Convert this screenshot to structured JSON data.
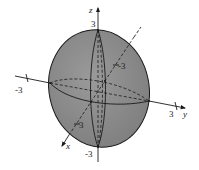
{
  "figure": {
    "type": "ellipsoid",
    "colors": {
      "surface": "#8a8a8a",
      "stroke": "#1a1a1a",
      "background": "#ffffff"
    },
    "axes": {
      "x": {
        "label": "x",
        "ticks": [
          "3",
          "-3"
        ]
      },
      "y": {
        "label": "y",
        "ticks": [
          "-3",
          "3"
        ]
      },
      "z": {
        "label": "z",
        "ticks": [
          "3",
          "-3"
        ]
      }
    }
  }
}
